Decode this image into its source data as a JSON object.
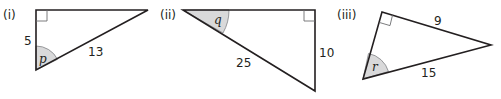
{
  "figure": {
    "triangles": [
      {
        "id": "i",
        "label": "(i)",
        "sides": {
          "vertical_leg": "5",
          "hypotenuse": "13"
        },
        "angle_label": "p",
        "right_angle": "top-left"
      },
      {
        "id": "ii",
        "label": "(ii)",
        "sides": {
          "vertical_leg": "10",
          "hypotenuse": "25"
        },
        "angle_label": "q",
        "right_angle": "top-right"
      },
      {
        "id": "iii",
        "label": "(iii)",
        "sides": {
          "leg": "9",
          "hypotenuse": "15"
        },
        "angle_label": "r",
        "right_angle": "top"
      }
    ],
    "colors": {
      "line": "#231f20",
      "angle_fill": "#d9d9da"
    }
  }
}
